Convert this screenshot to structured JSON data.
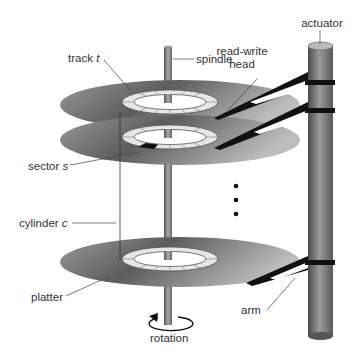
{
  "diagram": {
    "labels": {
      "track": "track",
      "track_var": "t",
      "spindle": "spindle",
      "read_write_head_line1": "read-write",
      "read_write_head_line2": "head",
      "actuator": "actuator",
      "sector": "sector",
      "sector_var": "s",
      "cylinder": "cylinder",
      "cylinder_var": "c",
      "platter": "platter",
      "arm": "arm",
      "rotation": "rotation"
    },
    "platter_count_visible": 3,
    "ellipsis_dots": 3,
    "colors": {
      "platter_dark": "#5a5a5a",
      "platter_light": "#d8d8d8",
      "track_segment": "#e6e6e6",
      "highlighted_sector": "#111111",
      "spindle": "#777777",
      "actuator": "#707070",
      "leader_line": "#444444",
      "text": "#333333"
    }
  }
}
